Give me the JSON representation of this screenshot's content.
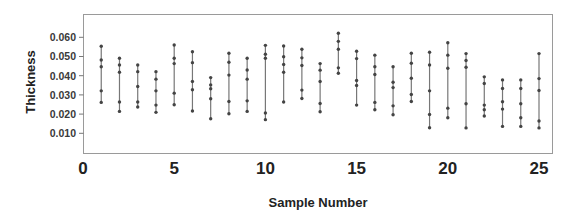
{
  "chart_data": {
    "type": "scatter",
    "subtype": "individual-value plot (vertical lines connecting points per sample)",
    "title": "",
    "xlabel": "Sample Number",
    "ylabel": "Thickness",
    "xlim": [
      0,
      25.7
    ],
    "ylim": [
      0.0,
      0.0655
    ],
    "x_ticks": [
      0,
      5,
      10,
      15,
      20,
      25
    ],
    "x_tick_labels": [
      "0",
      "5",
      "10",
      "15",
      "20",
      "25"
    ],
    "y_ticks": [
      0.01,
      0.02,
      0.03,
      0.04,
      0.05,
      0.06
    ],
    "y_tick_labels": [
      "0.010",
      "0.020",
      "0.030",
      "0.040",
      "0.050",
      "0.060"
    ],
    "grid": false,
    "legend": null,
    "colors": {
      "points": "#444444",
      "lines": "#777777",
      "frame": "#9a9a9a"
    },
    "samples": [
      {
        "x": 1,
        "values": [
          0.0553,
          0.0482,
          0.0447,
          0.0321,
          0.0261
        ]
      },
      {
        "x": 2,
        "values": [
          0.0491,
          0.0456,
          0.0418,
          0.0263,
          0.0214
        ]
      },
      {
        "x": 3,
        "values": [
          0.0456,
          0.0421,
          0.0344,
          0.0263,
          0.0237
        ]
      },
      {
        "x": 4,
        "values": [
          0.0421,
          0.0382,
          0.0321,
          0.0247,
          0.0209
        ]
      },
      {
        "x": 5,
        "values": [
          0.056,
          0.0491,
          0.0463,
          0.0309,
          0.0249
        ]
      },
      {
        "x": 6,
        "values": [
          0.0525,
          0.0468,
          0.037,
          0.0327,
          0.0216
        ]
      },
      {
        "x": 7,
        "values": [
          0.039,
          0.0352,
          0.0332,
          0.028,
          0.0176
        ]
      },
      {
        "x": 8,
        "values": [
          0.0517,
          0.047,
          0.0403,
          0.0266,
          0.0202
        ]
      },
      {
        "x": 9,
        "values": [
          0.0491,
          0.043,
          0.0382,
          0.0269,
          0.0214
        ]
      },
      {
        "x": 10,
        "values": [
          0.0558,
          0.0512,
          0.0491,
          0.0206,
          0.0171
        ]
      },
      {
        "x": 11,
        "values": [
          0.0555,
          0.0499,
          0.0458,
          0.0418,
          0.0263
        ]
      },
      {
        "x": 12,
        "values": [
          0.0538,
          0.0493,
          0.0453,
          0.0325,
          0.0281
        ]
      },
      {
        "x": 13,
        "values": [
          0.0463,
          0.0429,
          0.037,
          0.0255,
          0.0212
        ]
      },
      {
        "x": 14,
        "values": [
          0.0621,
          0.0579,
          0.0538,
          0.0441,
          0.0413
        ]
      },
      {
        "x": 15,
        "values": [
          0.0527,
          0.0489,
          0.0375,
          0.0349,
          0.0247
        ]
      },
      {
        "x": 16,
        "values": [
          0.0507,
          0.0447,
          0.0406,
          0.0261,
          0.0223
        ]
      },
      {
        "x": 17,
        "values": [
          0.0447,
          0.0366,
          0.0338,
          0.0243,
          0.0197
        ]
      },
      {
        "x": 18,
        "values": [
          0.0517,
          0.0465,
          0.0387,
          0.0302,
          0.0266
        ]
      },
      {
        "x": 19,
        "values": [
          0.0522,
          0.0456,
          0.0321,
          0.0198,
          0.0129
        ]
      },
      {
        "x": 20,
        "values": [
          0.0572,
          0.0507,
          0.0439,
          0.0231,
          0.0181
        ]
      },
      {
        "x": 21,
        "values": [
          0.0515,
          0.0479,
          0.0444,
          0.0254,
          0.0128
        ]
      },
      {
        "x": 22,
        "values": [
          0.0394,
          0.0359,
          0.0247,
          0.0223,
          0.019
        ]
      },
      {
        "x": 23,
        "values": [
          0.0378,
          0.0333,
          0.0264,
          0.0226,
          0.0136
        ]
      },
      {
        "x": 24,
        "values": [
          0.0378,
          0.0333,
          0.0254,
          0.0181,
          0.0136
        ]
      },
      {
        "x": 25,
        "values": [
          0.0515,
          0.0385,
          0.0323,
          0.0164,
          0.0128
        ]
      }
    ]
  }
}
